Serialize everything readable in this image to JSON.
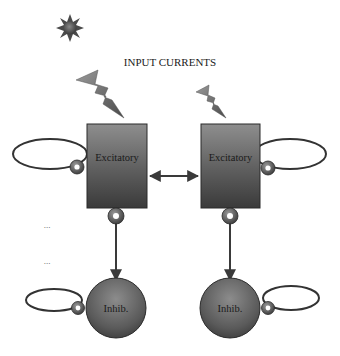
{
  "diagram": {
    "title": "INPUT CURRENTS",
    "icons": {
      "sun": "sun-icon",
      "input_left": "lightning-bolt-icon",
      "input_right": "lightning-bolt-icon"
    },
    "nodes": [
      {
        "id": "exc-left",
        "type": "excitatory",
        "shape": "rectangle",
        "label": "Excitatory"
      },
      {
        "id": "exc-right",
        "type": "excitatory",
        "shape": "rectangle",
        "label": "Excitatory"
      },
      {
        "id": "inh-left",
        "type": "inhibitory",
        "shape": "circle",
        "label": "Inhib."
      },
      {
        "id": "inh-right",
        "type": "inhibitory",
        "shape": "circle",
        "label": "Inhib."
      }
    ],
    "edges": [
      {
        "from": "exc-left",
        "to": "exc-right",
        "kind": "bidirectional-arrow"
      },
      {
        "from": "exc-left",
        "to": "inh-left",
        "kind": "arrow"
      },
      {
        "from": "exc-right",
        "to": "inh-right",
        "kind": "arrow"
      },
      {
        "from": "exc-left",
        "to": "exc-left",
        "kind": "self-loop"
      },
      {
        "from": "exc-right",
        "to": "exc-right",
        "kind": "self-loop"
      },
      {
        "from": "inh-left",
        "to": "inh-left",
        "kind": "self-loop"
      },
      {
        "from": "inh-right",
        "to": "inh-right",
        "kind": "self-loop"
      }
    ],
    "ellipsis_marks": [
      "...",
      "..."
    ],
    "colors": {
      "node_fill_light": "#8a8a8a",
      "node_fill_dark": "#3a3a3a",
      "stroke": "#2a2a2a",
      "bolt_fill": "#7a7a7a"
    }
  }
}
